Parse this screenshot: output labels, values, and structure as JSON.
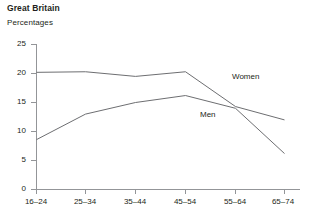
{
  "header": {
    "title": "Great Britain",
    "subtitle": "Percentages"
  },
  "chart_data": {
    "type": "line",
    "title": "Great Britain",
    "subtitle": "Percentages",
    "xlabel": "",
    "ylabel": "",
    "categories": [
      "16–24",
      "25–34",
      "35–44",
      "45–54",
      "55–64",
      "65–74"
    ],
    "ylim": [
      0,
      25
    ],
    "yticks": [
      0,
      5,
      10,
      15,
      20,
      25
    ],
    "ytick_labels": [
      "0",
      "5",
      "10",
      "15",
      "20",
      "25"
    ],
    "grid": false,
    "legend": "inline-annotations",
    "series": [
      {
        "name": "Women",
        "color": "#6d6e71",
        "values": [
          20.2,
          20.3,
          19.5,
          20.3,
          14.3,
          12.0
        ],
        "label": "Women"
      },
      {
        "name": "Men",
        "color": "#6d6e71",
        "values": [
          8.6,
          13.0,
          15.0,
          16.2,
          14.0,
          6.2
        ],
        "label": "Men"
      }
    ],
    "annotations": [
      {
        "text": "Women",
        "x": 232,
        "y": 79
      },
      {
        "text": "Men",
        "x": 200,
        "y": 116
      }
    ],
    "colors": {
      "line": "#6d6e71",
      "axis": "#939598",
      "text": "#231f20",
      "background": "#ffffff"
    }
  }
}
